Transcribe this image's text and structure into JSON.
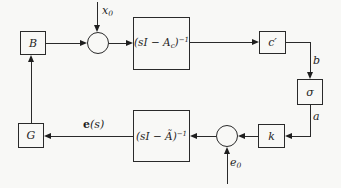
{
  "diagram": {
    "blocks": {
      "B": "B",
      "plant": {
        "pre": "(sI − A",
        "sub": "c",
        "close": ")",
        "sup": "−1"
      },
      "c_prime": "c′",
      "sigma": "σ",
      "k": "k",
      "observer": {
        "pre": "(sI − Ã",
        "close": ")",
        "sup": "−1"
      },
      "G": "G"
    },
    "signals": {
      "x0": {
        "main": "x",
        "sub": "0"
      },
      "e0": {
        "main": "e",
        "sub": "0"
      },
      "b": "b",
      "a": "a",
      "es": {
        "bold": "e",
        "rest": "(s)"
      }
    },
    "colors": {
      "ink": "#1e1e1e",
      "paper": "#f8f8f6"
    }
  }
}
